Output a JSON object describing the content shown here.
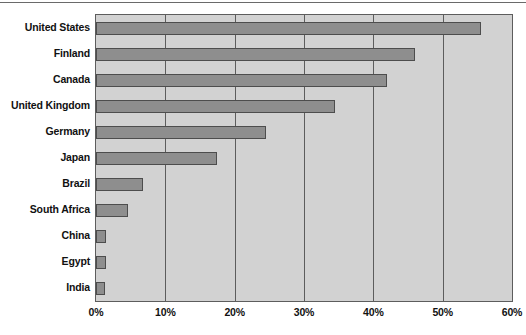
{
  "chart_data": {
    "type": "bar",
    "orientation": "horizontal",
    "title": "",
    "subtitle": "",
    "xlabel": "",
    "ylabel": "",
    "categories": [
      "United States",
      "Finland",
      "Canada",
      "United Kingdom",
      "Germany",
      "Japan",
      "Brazil",
      "South Africa",
      "China",
      "Egypt",
      "India"
    ],
    "values": [
      55.5,
      46.0,
      42.0,
      34.5,
      24.5,
      17.5,
      6.8,
      4.6,
      1.4,
      1.5,
      1.3
    ],
    "value_unit": "%",
    "xlim": [
      0,
      60
    ],
    "xticks": [
      0,
      10,
      20,
      30,
      40,
      50,
      60
    ],
    "xtick_labels": [
      "0%",
      "10%",
      "20%",
      "30%",
      "40%",
      "50%",
      "60%"
    ],
    "grid": true,
    "grid_axis": "x",
    "legend": false,
    "legend_position": "none",
    "series": [
      {
        "name": "",
        "values": [
          55.5,
          46.0,
          42.0,
          34.5,
          24.5,
          17.5,
          6.8,
          4.6,
          1.4,
          1.5,
          1.3
        ]
      }
    ]
  },
  "colors": {
    "bar_fill": "#8e8e8e",
    "bar_stroke": "#4d4d4d",
    "plot_background": "#d2d2d2",
    "plot_border": "#5d5d5d",
    "gridline": "#5d5d5d",
    "text": "#111111",
    "page_background": "#ffffff",
    "top_rule": "#6a6a6a"
  }
}
